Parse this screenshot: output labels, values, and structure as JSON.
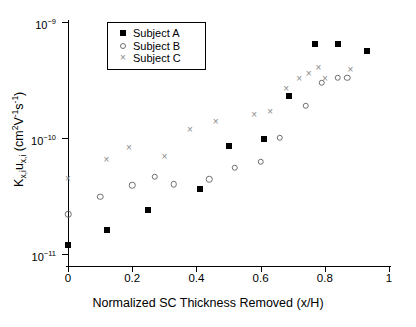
{
  "chart_data": {
    "type": "scatter",
    "title": "",
    "xlabel": "Normalized SC Thickness Removed (x/H)",
    "ylabel": "K_x,i u_x,i (cm2V-1s-1)",
    "xlim": [
      0,
      1
    ],
    "ylim": [
      8e-12,
      1e-09
    ],
    "yscale": "log",
    "xscale": "linear",
    "grid": false,
    "legend_position": "top-left-inside",
    "xticks": [
      0,
      0.2,
      0.4,
      0.6,
      0.8,
      1
    ],
    "xticklabels": [
      "0",
      "0.2",
      "0.4",
      "0.6",
      "0.8",
      "1"
    ],
    "yticks": [
      1e-11,
      1e-10,
      1e-09
    ],
    "yticklabels": [
      "10-11",
      "10-10",
      "10-9"
    ],
    "series": [
      {
        "name": "Subject A",
        "marker": "filled-square",
        "color": "#000000",
        "points": [
          {
            "x": 0.0,
            "y": 1.2e-11
          },
          {
            "x": 0.12,
            "y": 1.6e-11
          },
          {
            "x": 0.25,
            "y": 2.4e-11
          },
          {
            "x": 0.41,
            "y": 3.6e-11
          },
          {
            "x": 0.5,
            "y": 8.5e-11
          },
          {
            "x": 0.61,
            "y": 9.8e-11
          },
          {
            "x": 0.69,
            "y": 2.3e-10
          },
          {
            "x": 0.77,
            "y": 6.5e-10
          },
          {
            "x": 0.84,
            "y": 6.4e-10
          },
          {
            "x": 0.93,
            "y": 5.6e-10
          }
        ]
      },
      {
        "name": "Subject B",
        "marker": "open-circle",
        "color": "#6e6e6e",
        "points": [
          {
            "x": 0.0,
            "y": 2.2e-11
          },
          {
            "x": 0.1,
            "y": 3.1e-11
          },
          {
            "x": 0.2,
            "y": 3.9e-11
          },
          {
            "x": 0.27,
            "y": 4.6e-11
          },
          {
            "x": 0.33,
            "y": 4e-11
          },
          {
            "x": 0.44,
            "y": 4.4e-11
          },
          {
            "x": 0.52,
            "y": 5.5e-11
          },
          {
            "x": 0.6,
            "y": 6.2e-11
          },
          {
            "x": 0.66,
            "y": 1e-10
          },
          {
            "x": 0.74,
            "y": 1.9e-10
          },
          {
            "x": 0.79,
            "y": 3e-10
          },
          {
            "x": 0.84,
            "y": 3.3e-10
          },
          {
            "x": 0.87,
            "y": 3.3e-10
          }
        ]
      },
      {
        "name": "Subject C",
        "marker": "cross",
        "color": "#8a8a8a",
        "points": [
          {
            "x": 0.0,
            "y": 4.5e-11
          },
          {
            "x": 0.12,
            "y": 6.6e-11
          },
          {
            "x": 0.19,
            "y": 8.3e-11
          },
          {
            "x": 0.3,
            "y": 7e-11
          },
          {
            "x": 0.38,
            "y": 1.2e-10
          },
          {
            "x": 0.46,
            "y": 1.4e-10
          },
          {
            "x": 0.58,
            "y": 1.6e-10
          },
          {
            "x": 0.63,
            "y": 1.7e-10
          },
          {
            "x": 0.68,
            "y": 2.7e-10
          },
          {
            "x": 0.72,
            "y": 3.3e-10
          },
          {
            "x": 0.75,
            "y": 3.6e-10
          },
          {
            "x": 0.78,
            "y": 4.1e-10
          },
          {
            "x": 0.8,
            "y": 3.3e-10
          },
          {
            "x": 0.88,
            "y": 3.9e-10
          }
        ]
      }
    ]
  },
  "legend": {
    "items": [
      {
        "label": "Subject A"
      },
      {
        "label": "Subject B"
      },
      {
        "label": "Subject C"
      }
    ]
  },
  "axis_titles": {
    "x": "Normalized SC Thickness Removed (x/H)",
    "y_main": "K",
    "y_sub1": "x,i",
    "y_mid": "u",
    "y_sub2": "x,i",
    "y_units_open": " (cm",
    "y_units_sup1": "2",
    "y_units_v": "V",
    "y_units_sup2": "-1",
    "y_units_s": "s",
    "y_units_sup3": "-1",
    "y_units_close": ")"
  }
}
